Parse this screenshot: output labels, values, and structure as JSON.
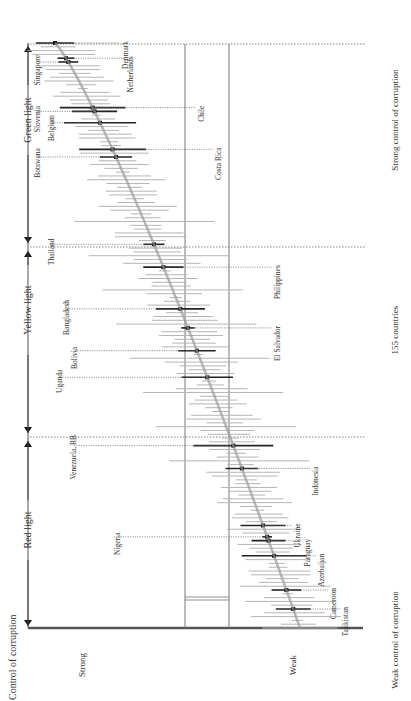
{
  "chart_data": {
    "type": "scatter",
    "orientation": "rotated-90-ccw",
    "title": "Control of corruption",
    "xlabel_left": "Weak control of corruption",
    "xlabel_right": "Strong control of corruption",
    "xlabel_center": "155 countries",
    "ylabel_low": "Strong",
    "ylabel_high": "Weak",
    "n_countries": 155,
    "zones": [
      {
        "label": "Red light",
        "from_rank": 1,
        "to_rank": 39
      },
      {
        "label": "Yellow light",
        "from_rank": 39,
        "to_rank": 104
      },
      {
        "label": "Green light",
        "from_rank": 104,
        "to_rank": 155
      }
    ],
    "reference_lines": [
      "threshold-a",
      "threshold-b"
    ],
    "highlighted_countries": [
      {
        "name": "Tajikistan",
        "rank": 6
      },
      {
        "name": "Cameroon",
        "rank": 11
      },
      {
        "name": "Azerbaijan",
        "rank": 20
      },
      {
        "name": "Paraguay",
        "rank": 24
      },
      {
        "name": "Ukraine",
        "rank": 28
      },
      {
        "name": "Nigeria",
        "rank": 25
      },
      {
        "name": "Indonesia",
        "rank": 43
      },
      {
        "name": "Venezuela, RB",
        "rank": 49
      },
      {
        "name": "Uganda",
        "rank": 67
      },
      {
        "name": "Bolivia",
        "rank": 74
      },
      {
        "name": "El Salvador",
        "rank": 80
      },
      {
        "name": "Bangladesh",
        "rank": 85
      },
      {
        "name": "Philippines",
        "rank": 96
      },
      {
        "name": "Thailand",
        "rank": 102
      },
      {
        "name": "Botswana",
        "rank": 125
      },
      {
        "name": "Costa Rica",
        "rank": 127
      },
      {
        "name": "Belgium",
        "rank": 134
      },
      {
        "name": "Slovenia",
        "rank": 137
      },
      {
        "name": "Chile",
        "rank": 138
      },
      {
        "name": "Singapore",
        "rank": 150
      },
      {
        "name": "Netherlands",
        "rank": 151
      },
      {
        "name": "Denmark",
        "rank": 155
      }
    ]
  },
  "labels": {
    "title": "Control of corruption",
    "strong": "Strong",
    "weak": "Weak",
    "red": "Red light",
    "yellow": "Yellow light",
    "green": "Green light",
    "weak_ctrl": "Weak control of corruption",
    "strong_ctrl": "Strong control of corruption",
    "count": "155 countries"
  },
  "colors": {
    "axis": "#555555",
    "bar": "#b5b5b5",
    "highlight": "#222222",
    "curve": "#9a9a9a",
    "ref": "#777777",
    "dotted": "#666666"
  }
}
